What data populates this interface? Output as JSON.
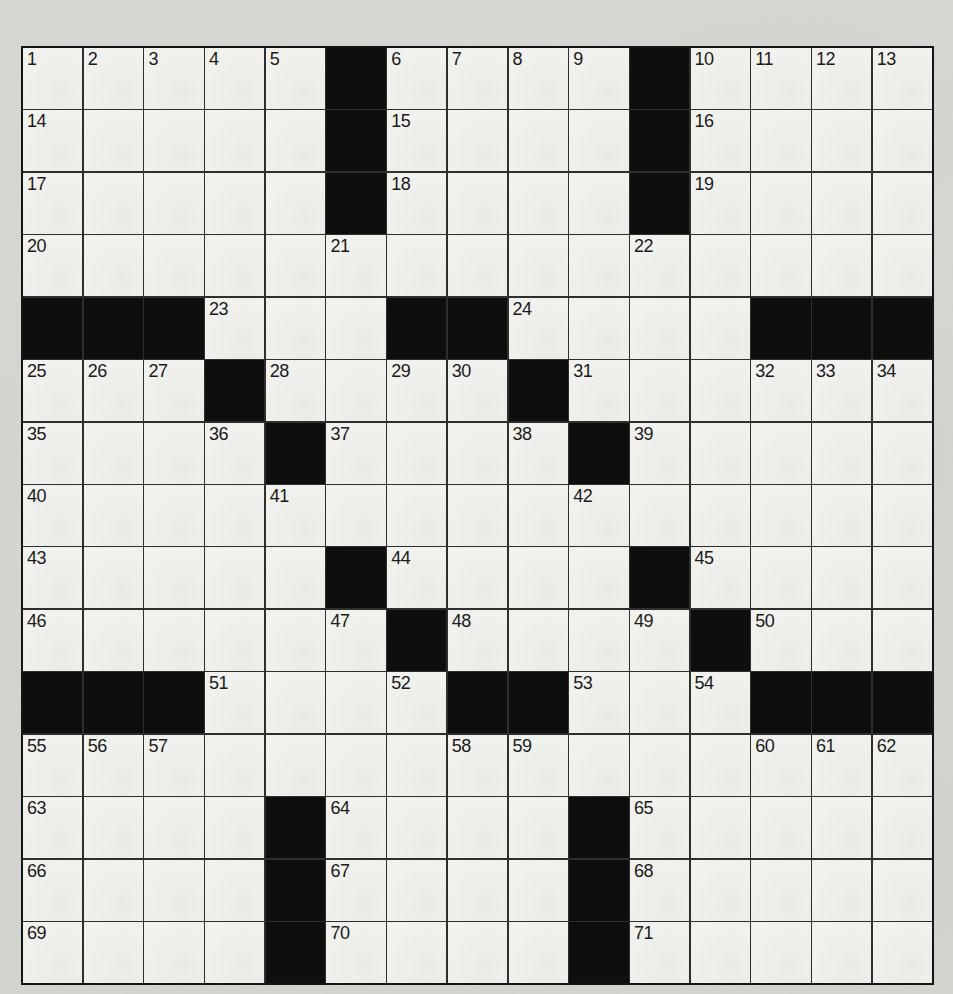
{
  "puzzle": {
    "kind": "crossword",
    "rows": 15,
    "cols": 15,
    "grid": [
      ".....#....#....",
      ".....#....#....",
      ".....#....#....",
      "...............",
      "###...##....###",
      "...#....#......",
      "....#....#.....",
      "...............",
      ".....#....#....",
      "......#....#...",
      "###....##...###",
      "...............",
      "....#....#.....",
      "....#....#.....",
      "....#....#....."
    ],
    "numbers": [
      [
        1,
        2,
        3,
        4,
        5,
        0,
        6,
        7,
        8,
        9,
        0,
        10,
        11,
        12,
        13
      ],
      [
        14,
        0,
        0,
        0,
        0,
        0,
        15,
        0,
        0,
        0,
        0,
        16,
        0,
        0,
        0
      ],
      [
        17,
        0,
        0,
        0,
        0,
        0,
        18,
        0,
        0,
        0,
        0,
        19,
        0,
        0,
        0
      ],
      [
        20,
        0,
        0,
        0,
        0,
        21,
        0,
        0,
        0,
        0,
        22,
        0,
        0,
        0,
        0
      ],
      [
        0,
        0,
        0,
        23,
        0,
        0,
        0,
        0,
        24,
        0,
        0,
        0,
        0,
        0,
        0
      ],
      [
        25,
        26,
        27,
        0,
        28,
        0,
        29,
        30,
        0,
        31,
        0,
        0,
        32,
        33,
        34
      ],
      [
        35,
        0,
        0,
        36,
        0,
        37,
        0,
        0,
        38,
        0,
        39,
        0,
        0,
        0,
        0
      ],
      [
        40,
        0,
        0,
        0,
        41,
        0,
        0,
        0,
        0,
        42,
        0,
        0,
        0,
        0,
        0
      ],
      [
        43,
        0,
        0,
        0,
        0,
        0,
        44,
        0,
        0,
        0,
        0,
        45,
        0,
        0,
        0
      ],
      [
        46,
        0,
        0,
        0,
        0,
        47,
        0,
        48,
        0,
        0,
        49,
        0,
        50,
        0,
        0
      ],
      [
        0,
        0,
        0,
        51,
        0,
        0,
        52,
        0,
        0,
        53,
        0,
        54,
        0,
        0,
        0
      ],
      [
        55,
        56,
        57,
        0,
        0,
        0,
        0,
        58,
        59,
        0,
        0,
        0,
        60,
        61,
        62
      ],
      [
        63,
        0,
        0,
        0,
        0,
        64,
        0,
        0,
        0,
        0,
        65,
        0,
        0,
        0,
        0
      ],
      [
        66,
        0,
        0,
        0,
        0,
        67,
        0,
        0,
        0,
        0,
        68,
        0,
        0,
        0,
        0
      ],
      [
        69,
        0,
        0,
        0,
        0,
        70,
        0,
        0,
        0,
        0,
        71,
        0,
        0,
        0,
        0
      ]
    ]
  },
  "colors": {
    "page_background": "#d7d7d2",
    "cell_background": "#f1f1ee",
    "black_cell": "#0e0e0e",
    "grid_line": "#2e2e2c",
    "outer_border": "#141414",
    "number_color": "#1b1b1b"
  }
}
